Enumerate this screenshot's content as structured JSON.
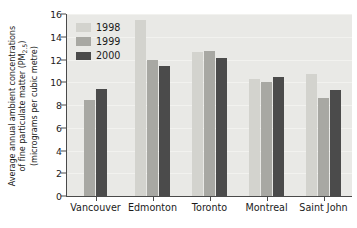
{
  "chart_data": {
    "type": "bar",
    "title": "",
    "subtitle": "",
    "xlabel": "",
    "ylabel": "Average annual ambient concentrations of fine particulate matter (PM2.5) (micrograms per cubic metre)",
    "ylabel_lines": [
      "Average annual ambient concentrations",
      "of fine particulate matter (PM",
      "(micrograms per cubic metre)"
    ],
    "ylabel_subscript": "2.5",
    "categories": [
      "Vancouver",
      "Edmonton",
      "Toronto",
      "Montreal",
      "Saint John"
    ],
    "series": [
      {
        "name": "1998",
        "color": "#d3d3ce",
        "values": [
          null,
          15.5,
          12.7,
          10.25,
          10.7
        ]
      },
      {
        "name": "1999",
        "color": "#a8a8a3",
        "values": [
          8.4,
          12.0,
          12.75,
          10.05,
          8.6
        ]
      },
      {
        "name": "2000",
        "color": "#4b4b4b",
        "values": [
          9.4,
          11.4,
          12.1,
          10.5,
          9.3
        ]
      }
    ],
    "ylim": [
      0,
      16
    ],
    "yticks": [
      0,
      2,
      4,
      6,
      8,
      10,
      12,
      14,
      16
    ],
    "ytick_labels": [
      "0",
      "2",
      "4",
      "6",
      "8",
      "10",
      "12",
      "14",
      "16"
    ],
    "grid": true,
    "legend_position": "top-left-inside",
    "legend_entries": [
      "1998",
      "1999",
      "2000"
    ],
    "plot_background": "#e9e9e6",
    "figure_background": "#ffffff",
    "axis_color": "#4a4a4a",
    "gridline_color": "#f4f4f2"
  }
}
